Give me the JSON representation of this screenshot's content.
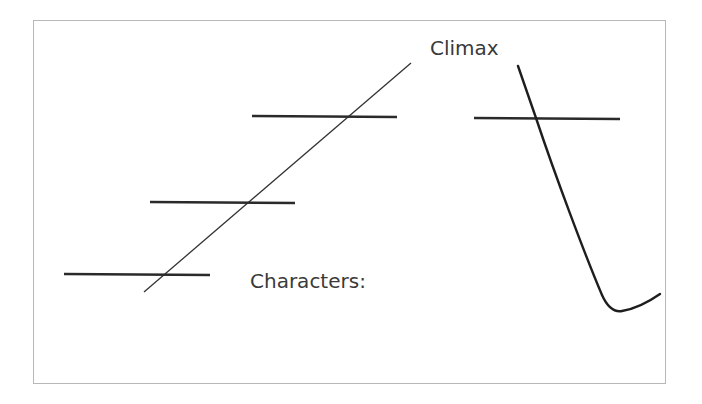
{
  "diagram": {
    "type": "plot-structure-diagram",
    "labels": {
      "climax": "Climax",
      "characters": "Characters:"
    },
    "colors": {
      "line": "#2a2a2a",
      "border": "#b8b8b8",
      "text": "#3a3a3a",
      "background": "#ffffff"
    },
    "rising_action_blanks": 3,
    "falling_action_blanks": 1
  }
}
